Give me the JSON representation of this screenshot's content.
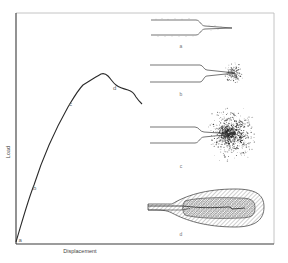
{
  "figure": {
    "type": "load-displacement diagram with crack-tip damage zone illustrations",
    "x_axis_label": "Displacement",
    "y_axis_label": "Load",
    "colors": {
      "line": "#2a2a2a",
      "frame": "#9a9a9a",
      "text": "#555555",
      "hatch": "#777777"
    }
  },
  "curve": {
    "points_labels": [
      {
        "id": "a",
        "label": "a"
      },
      {
        "id": "b",
        "label": "b"
      },
      {
        "id": "c",
        "label": "c"
      },
      {
        "id": "d",
        "label": "d"
      }
    ]
  },
  "panels": [
    {
      "id": "a",
      "label": "a",
      "description": "sharp crack tip, no damage zone"
    },
    {
      "id": "b",
      "label": "b",
      "description": "small diffuse damage zone at crack tip"
    },
    {
      "id": "c",
      "label": "c",
      "description": "large dense microcracking zone ahead of crack"
    },
    {
      "id": "d",
      "label": "d",
      "description": "developed fracture process zone with hatched boundaries"
    }
  ],
  "chart_data": {
    "type": "line",
    "title": "",
    "xlabel": "Displacement",
    "ylabel": "Load",
    "x": [
      0,
      0.05,
      0.1,
      0.2,
      0.3,
      0.4,
      0.5,
      0.55,
      0.6,
      0.65,
      0.7,
      0.75,
      0.78
    ],
    "series": [
      {
        "name": "Load-displacement",
        "values": [
          0,
          0.28,
          0.5,
          0.75,
          0.87,
          0.94,
          0.97,
          0.92,
          0.88,
          0.85,
          0.84,
          0.78,
          0.77
        ]
      }
    ],
    "annotations": [
      {
        "label": "a",
        "x": 0.0,
        "y": 0.0
      },
      {
        "label": "b",
        "x": 0.08,
        "y": 0.27
      },
      {
        "label": "c",
        "x": 0.27,
        "y": 0.74
      },
      {
        "label": "d",
        "x": 0.62,
        "y": 0.88
      }
    ],
    "grid": false,
    "xlim": [
      0,
      1
    ],
    "ylim": [
      0,
      1.2
    ]
  }
}
